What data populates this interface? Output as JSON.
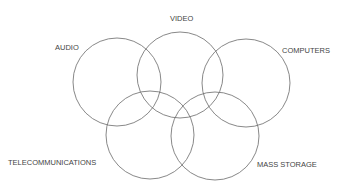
{
  "diagram": {
    "type": "venn",
    "stroke_color": "#6a6a6a",
    "label_color": "#444444",
    "circles": [
      {
        "id": "audio",
        "label": "AUDIO",
        "cx": 117,
        "cy": 82,
        "r": 44,
        "lx": 55,
        "ly": 50
      },
      {
        "id": "video",
        "label": "VIDEO",
        "cx": 180,
        "cy": 75,
        "r": 43,
        "lx": 170,
        "ly": 21
      },
      {
        "id": "computers",
        "label": "COMPUTERS",
        "cx": 246,
        "cy": 83,
        "r": 44,
        "lx": 282,
        "ly": 53
      },
      {
        "id": "telecommunications",
        "label": "TELECOMMUNICATIONS",
        "cx": 150,
        "cy": 135,
        "r": 44,
        "lx": 8,
        "ly": 165
      },
      {
        "id": "mass-storage",
        "label": "MASS STORAGE",
        "cx": 215,
        "cy": 136,
        "r": 44,
        "lx": 257,
        "ly": 167
      }
    ]
  }
}
